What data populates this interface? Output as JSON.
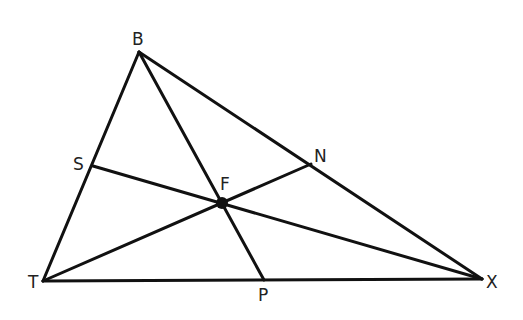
{
  "diagram": {
    "type": "triangle-cevians",
    "line_color": "#111111",
    "label_color": "#222222",
    "points": {
      "B": {
        "label": "B",
        "x": 139,
        "y": 52
      },
      "T": {
        "label": "T",
        "x": 43,
        "y": 281
      },
      "X": {
        "label": "X",
        "x": 482,
        "y": 279
      },
      "F": {
        "label": "F",
        "x": 222,
        "y": 203
      },
      "S": {
        "label": "S",
        "x": 93,
        "y": 166
      },
      "N": {
        "label": "N",
        "x": 311,
        "y": 164
      },
      "P": {
        "label": "P",
        "x": 264,
        "y": 280
      }
    },
    "segments": [
      [
        "B",
        "T"
      ],
      [
        "B",
        "X"
      ],
      [
        "T",
        "X"
      ],
      [
        "B",
        "P"
      ],
      [
        "T",
        "N"
      ],
      [
        "S",
        "X"
      ]
    ],
    "intersection_point": "F"
  }
}
